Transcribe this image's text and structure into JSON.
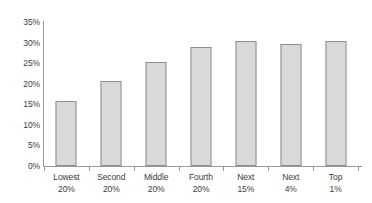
{
  "chart_data": {
    "type": "bar",
    "title": "",
    "subtitle": "",
    "xlabel": "",
    "ylabel": "",
    "categories": [
      "Lowest 20%",
      "Second 20%",
      "Middle 20%",
      "Fourth 20%",
      "Next 15%",
      "Next 4%",
      "Top 1%"
    ],
    "category_lines": [
      [
        "Lowest",
        "20%"
      ],
      [
        "Second",
        "20%"
      ],
      [
        "Middle",
        "20%"
      ],
      [
        "Fourth",
        "20%"
      ],
      [
        "Next",
        "15%"
      ],
      [
        "Next",
        "4%"
      ],
      [
        "Top",
        "1%"
      ]
    ],
    "values": [
      15.7,
      20.7,
      25.4,
      28.9,
      30.3,
      29.6,
      30.3
    ],
    "value_labels": [
      "15.7%",
      "20.7%",
      "25.4%",
      "28.9%",
      "30.3%",
      "29.6%",
      "30.3%"
    ],
    "ylim": [
      0,
      35
    ],
    "ytick_values": [
      0,
      5,
      10,
      15,
      20,
      25,
      30,
      35
    ],
    "ytick_labels": [
      "0%",
      "5%",
      "10%",
      "15%",
      "20%",
      "25%",
      "30%",
      "35%"
    ],
    "grid": false,
    "legend": null,
    "legend_position": "none",
    "colors": {
      "bar_fill": "#d9d9d9",
      "bar_border": "#8e8e8e",
      "axis": "#9a9a9a",
      "text": "#3d3d3d",
      "background": "#ffffff"
    }
  }
}
